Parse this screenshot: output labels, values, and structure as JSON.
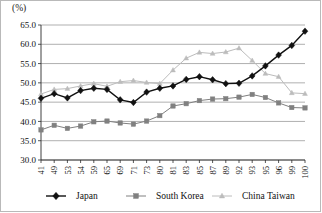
{
  "chart_data": {
    "type": "line",
    "title": "",
    "subtitle": "",
    "xlabel": "",
    "ylabel": "(%)",
    "ylim": [
      30.0,
      65.0
    ],
    "yticks": [
      "30.0",
      "35.0",
      "40.0",
      "45.0",
      "50.0",
      "55.0",
      "60.0",
      "65.0"
    ],
    "ytick_values": [
      30.0,
      35.0,
      40.0,
      45.0,
      50.0,
      55.0,
      60.0,
      65.0
    ],
    "grid": true,
    "legend_position": "bottom",
    "categories": [
      "41",
      "49",
      "53",
      "54",
      "59",
      "65",
      "69",
      "71",
      "73",
      "80",
      "81",
      "83",
      "85",
      "87",
      "89",
      "92",
      "93",
      "95",
      "96",
      "99",
      "100"
    ],
    "series": [
      {
        "name": "Japan",
        "color": "#111111",
        "marker": "diamond",
        "values": [
          46.0,
          47.2,
          46.1,
          48.0,
          48.6,
          48.3,
          45.6,
          44.9,
          47.6,
          48.6,
          49.2,
          50.9,
          51.6,
          50.8,
          49.8,
          49.9,
          50.0,
          50.6,
          51.8,
          54.0,
          53.1
        ]
      },
      {
        "name": "South Korea",
        "color": "#808080",
        "marker": "square",
        "values": [
          37.8,
          39.0,
          38.2,
          38.8,
          39.9,
          40.1,
          39.6,
          39.3,
          40.1,
          41.5,
          44.0,
          44.6,
          45.4,
          45.8,
          45.9,
          46.3,
          47.0,
          46.2,
          44.8,
          43.6,
          43.5
        ]
      },
      {
        "name": "China Taiwan",
        "color": "#bcbcbc",
        "marker": "triangle",
        "values": [
          47.1,
          48.3,
          48.5,
          49.2,
          49.8,
          49.1,
          50.3,
          50.6,
          50.1,
          49.8,
          53.3,
          56.4,
          57.9,
          57.6,
          58.0,
          59.0,
          55.8,
          52.4,
          51.6,
          47.4,
          47.2
        ]
      }
    ],
    "japan_tail_override": {
      "note_visible_points": [
        51.8,
        54.4,
        57.2,
        59.7,
        63.4
      ]
    }
  },
  "legend": {
    "items": [
      {
        "label": "Japan",
        "color": "#111111",
        "marker": "diamond"
      },
      {
        "label": "South Korea",
        "color": "#808080",
        "marker": "square"
      },
      {
        "label": "China Taiwan",
        "color": "#bcbcbc",
        "marker": "triangle"
      }
    ]
  }
}
